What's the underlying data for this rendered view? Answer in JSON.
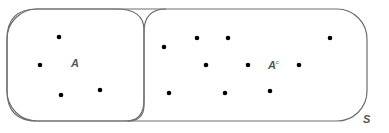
{
  "diagram": {
    "type": "venn",
    "universe_label": "S",
    "set_label": "A",
    "complement_label": "A",
    "complement_superscript": "c",
    "colors": {
      "outline": "#6e6e6e",
      "point": "#000000",
      "label": "#555555"
    },
    "points_in_A": [
      [
        59,
        37
      ],
      [
        40,
        65
      ],
      [
        61,
        95
      ],
      [
        100,
        90
      ]
    ],
    "points_in_complement": [
      [
        164,
        47
      ],
      [
        197,
        38
      ],
      [
        228,
        38
      ],
      [
        330,
        38
      ],
      [
        206,
        65
      ],
      [
        248,
        65
      ],
      [
        299,
        65
      ],
      [
        169,
        93
      ],
      [
        225,
        93
      ],
      [
        270,
        91
      ]
    ]
  }
}
